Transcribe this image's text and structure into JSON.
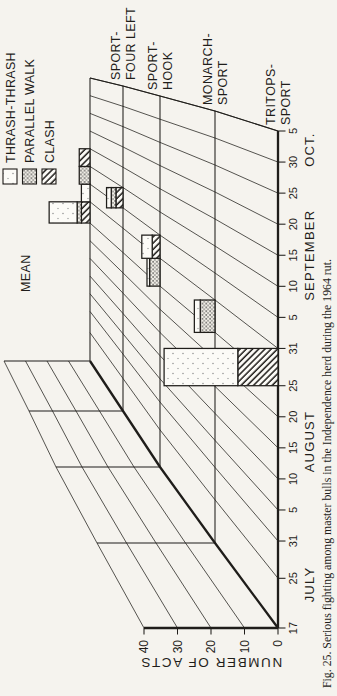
{
  "caption": "Fig. 25. Serious fighting among master bulls in the Independence herd during the 1964 rut.",
  "colors": {
    "ink": "#1f1d1a",
    "paper": "#f5f3ee"
  },
  "chart_data": {
    "type": "bar",
    "style": "3d-perspective stacked bars, one depth row per bull",
    "title": "Fig. 25. Serious fighting among master bulls in the Independence herd during the 1964 rut.",
    "ylabel": "NUMBER OF ACTS",
    "ylim": [
      0,
      40
    ],
    "y_ticks": [
      "0",
      "10",
      "20",
      "30",
      "40"
    ],
    "x_ticks": [
      {
        "label": "17",
        "day": 0
      },
      {
        "label": "25",
        "day": 8
      },
      {
        "label": "31",
        "day": 14
      },
      {
        "label": "5",
        "day": 19
      },
      {
        "label": "10",
        "day": 24
      },
      {
        "label": "15",
        "day": 29
      },
      {
        "label": "20",
        "day": 34
      },
      {
        "label": "25",
        "day": 39
      },
      {
        "label": "31",
        "day": 45
      },
      {
        "label": "5",
        "day": 50
      },
      {
        "label": "10",
        "day": 55
      },
      {
        "label": "15",
        "day": 60
      },
      {
        "label": "20",
        "day": 65
      },
      {
        "label": "25",
        "day": 70
      },
      {
        "label": "30",
        "day": 75
      },
      {
        "label": "5",
        "day": 80
      }
    ],
    "months": [
      {
        "label": "JULY",
        "day": 7
      },
      {
        "label": "AUGUST",
        "day": 30
      },
      {
        "label": "SEPTEMBER",
        "day": 60
      },
      {
        "label": "OCT.",
        "day": 77
      }
    ],
    "legend": [
      {
        "label": "THRASH-THRASH",
        "type": "thrash_thrash"
      },
      {
        "label": "PARALLEL WALK",
        "type": "parallel_walk"
      },
      {
        "label": "CLASH",
        "type": "clash"
      }
    ],
    "rows_front_to_back": [
      {
        "name": "TRITOPS-SPORT",
        "label_lines": [
          "TRITOPS-",
          "SPORT"
        ]
      },
      {
        "name": "MONARCH-SPORT",
        "label_lines": [
          "MONARCH-",
          "SPORT"
        ]
      },
      {
        "name": "SPORT-HOOK",
        "label_lines": [
          "SPORT-",
          "HOOK"
        ]
      },
      {
        "name": "SPORT-FOUR LEFT",
        "label_lines": [
          "SPORT-",
          "FOUR LEFT"
        ]
      },
      {
        "name": "MEAN",
        "label_lines": [
          "MEAN"
        ]
      }
    ],
    "bars": [
      {
        "row": "TRITOPS-SPORT",
        "interval": "Aug 25-31",
        "days": [
          39,
          45
        ],
        "segments": [
          {
            "type": "clash",
            "acts": 12
          },
          {
            "type": "thrash_thrash",
            "acts": 22
          }
        ]
      },
      {
        "row": "MONARCH-SPORT",
        "interval": "Aug 25-31",
        "days": [
          39,
          45
        ],
        "segments": [
          {
            "type": "parallel_walk",
            "acts": 5
          },
          {
            "type": "thrash_thrash",
            "acts": 2
          }
        ]
      },
      {
        "row": "SPORT-HOOK",
        "interval": "Aug 25-31",
        "days": [
          39,
          45
        ],
        "segments": [
          {
            "type": "parallel_walk",
            "acts": 4
          },
          {
            "type": "thrash_thrash",
            "acts": 1
          }
        ]
      },
      {
        "row": "SPORT-HOOK",
        "interval": "Aug 31-Sep 5",
        "days": [
          45,
          50
        ],
        "segments": [
          {
            "type": "clash",
            "acts": 3
          },
          {
            "type": "thrash_thrash",
            "acts": 4
          }
        ]
      },
      {
        "row": "SPORT-FOUR LEFT",
        "interval": "Sep 5-10",
        "days": [
          50,
          55
        ],
        "segments": [
          {
            "type": "clash",
            "acts": 3
          },
          {
            "type": "parallel_walk",
            "acts": 2
          },
          {
            "type": "thrash_thrash",
            "acts": 2
          }
        ]
      },
      {
        "row": "MEAN",
        "interval": "Aug 25-31",
        "days": [
          39,
          45
        ],
        "segments": [
          {
            "type": "clash",
            "acts": 4
          },
          {
            "type": "parallel_walk",
            "acts": 2
          },
          {
            "type": "thrash_thrash",
            "acts": 13
          }
        ]
      },
      {
        "row": "MEAN",
        "interval": "Aug 31-Sep 5",
        "days": [
          45,
          50
        ],
        "segments": [
          {
            "type": "thrash_thrash",
            "acts": 4
          }
        ]
      },
      {
        "row": "MEAN",
        "interval": "Sep 5-10",
        "days": [
          50,
          55
        ],
        "segments": [
          {
            "type": "parallel_walk",
            "acts": 5
          }
        ]
      },
      {
        "row": "MEAN",
        "interval": "Sep 10-15",
        "days": [
          55,
          60
        ],
        "segments": [
          {
            "type": "clash",
            "acts": 5
          }
        ]
      }
    ]
  }
}
